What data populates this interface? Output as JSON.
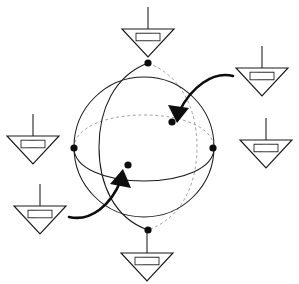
{
  "figure": {
    "background_color": "#ffffff",
    "line_color": "#1a1a1a",
    "hidden_line_color": "#9a9a9a",
    "dot_color": "#0d0d0d",
    "bar_dark_color": "#141414",
    "bar_light_color": "#ffffff"
  },
  "sphere": {
    "center_x": 144,
    "center_y": 147,
    "radius": 70,
    "outline_label": "sphere-outline",
    "meridian_front_label": "vertical-great-circle-front",
    "meridian_back_label": "vertical-great-circle-back",
    "equator_front_label": "equator-front",
    "equator_back_label": "equator-back"
  },
  "nodes": [
    {
      "name": "north-pole-node",
      "x": 148,
      "y": 63
    },
    {
      "name": "south-pole-node",
      "x": 148,
      "y": 230
    },
    {
      "name": "left-equator-node",
      "x": 74,
      "y": 148
    },
    {
      "name": "right-equator-node",
      "x": 213,
      "y": 148
    },
    {
      "name": "upper-interior-node",
      "x": 172,
      "y": 122
    },
    {
      "name": "lower-interior-node",
      "x": 128,
      "y": 165
    }
  ],
  "detectors": [
    {
      "id": "detector-top",
      "name": "detector-top",
      "position": "top",
      "apex_x": 148,
      "apex_y": 57,
      "half_width": 26,
      "height": 28,
      "stem_length": 22,
      "bar_cells": [
        "dark",
        "dark",
        "light"
      ]
    },
    {
      "id": "detector-top-right",
      "name": "detector-top-right",
      "position": "top-right",
      "apex_x": 262,
      "apex_y": 96,
      "half_width": 26,
      "height": 28,
      "stem_length": 22,
      "bar_cells": [
        "light",
        "dark",
        "dark"
      ]
    },
    {
      "id": "detector-right",
      "name": "detector-right",
      "position": "right",
      "apex_x": 266,
      "apex_y": 168,
      "half_width": 26,
      "height": 28,
      "stem_length": 22,
      "bar_cells": [
        "dark",
        "light",
        "dark"
      ]
    },
    {
      "id": "detector-left",
      "name": "detector-left",
      "position": "left",
      "apex_x": 33,
      "apex_y": 164,
      "half_width": 26,
      "height": 28,
      "stem_length": 22,
      "bar_cells": [
        "light",
        "dark",
        "light"
      ]
    },
    {
      "id": "detector-bottom-left",
      "name": "detector-bottom-left",
      "position": "bottom-left",
      "apex_x": 40,
      "apex_y": 234,
      "half_width": 26,
      "height": 28,
      "stem_length": 22,
      "bar_cells": [
        "dark",
        "light",
        "light"
      ]
    },
    {
      "id": "detector-bottom",
      "name": "detector-bottom",
      "position": "bottom",
      "apex_x": 147,
      "apex_y": 281,
      "half_width": 26,
      "height": 28,
      "stem_length": 22,
      "bar_cells": [
        "light",
        "dark",
        "dark"
      ]
    }
  ],
  "arrows": [
    {
      "name": "arrow-upper-right",
      "from_detector": "detector-top-right",
      "to_node": "upper-interior-node",
      "path": "M 232 77 C 212 72, 190 88, 178 114",
      "head_points": "178,122 170,107 188,110"
    },
    {
      "name": "arrow-lower-left",
      "from_detector": "detector-bottom-left",
      "to_node": "lower-interior-node",
      "path": "M 70 217 C 92 222, 112 204, 122 178",
      "head_points": "121,170 130,185 112,182"
    }
  ]
}
